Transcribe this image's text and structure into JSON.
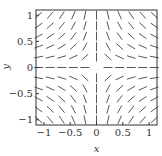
{
  "chart_data": {
    "type": "slope_field",
    "title": "",
    "xlabel": "x",
    "ylabel": "y",
    "xlim": [
      -1.15,
      1.15
    ],
    "ylim": [
      -1.1,
      1.1
    ],
    "xticks": [
      -1,
      -0.5,
      0,
      0.5,
      1
    ],
    "xtick_labels": [
      "−1",
      "−0.5",
      "0",
      "0.5",
      "1"
    ],
    "yticks": [
      -1,
      -0.5,
      0,
      0.5,
      1
    ],
    "ytick_labels": [
      "−1",
      "−0.5",
      "0",
      "0.5",
      "1"
    ],
    "grid": false,
    "legend": null,
    "field": "dy/dx = -y/x",
    "grid_points_x": [
      -1.1,
      -0.88,
      -0.66,
      -0.44,
      -0.22,
      0,
      0.22,
      0.44,
      0.66,
      0.88,
      1.1
    ],
    "grid_points_y": [
      -1.0,
      -0.8,
      -0.6,
      -0.4,
      -0.2,
      0,
      0.2,
      0.4,
      0.6,
      0.8,
      1.0
    ],
    "segment_color": "#444444",
    "frame_color": "#333333"
  }
}
